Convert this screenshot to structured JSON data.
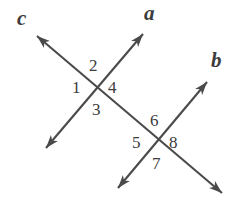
{
  "figure": {
    "kind": "geometry-diagram",
    "width": 245,
    "height": 204,
    "background_color": "#ffffff",
    "stroke_color": "#4a4a4a",
    "text_color": "#3c3c3c"
  },
  "lines": [
    {
      "id": "line-c",
      "label": "c",
      "label_x": 17,
      "label_y": 8,
      "start_x": 37,
      "start_y": 36,
      "end_x": 222,
      "end_y": 193,
      "arrow_start": true,
      "arrow_end": true
    },
    {
      "id": "line-a",
      "label": "a",
      "label_x": 144,
      "label_y": 3,
      "start_x": 143,
      "start_y": 34,
      "end_x": 46,
      "end_y": 148,
      "arrow_start": true,
      "arrow_end": true
    },
    {
      "id": "line-b",
      "label": "b",
      "label_x": 211,
      "label_y": 50,
      "start_x": 207,
      "start_y": 82,
      "end_x": 118,
      "end_y": 188,
      "arrow_start": true,
      "arrow_end": true
    }
  ],
  "intersections": [
    {
      "id": "intersection-upper",
      "x": 97,
      "y": 88,
      "lines": [
        "line-c",
        "line-a"
      ]
    },
    {
      "id": "intersection-lower",
      "x": 157,
      "y": 142,
      "lines": [
        "line-c",
        "line-b"
      ]
    }
  ],
  "angle_labels": [
    {
      "id": "angle-1",
      "text": "1",
      "x": 72,
      "y": 79,
      "intersection": "intersection-upper",
      "position": "left"
    },
    {
      "id": "angle-2",
      "text": "2",
      "x": 89,
      "y": 57,
      "intersection": "intersection-upper",
      "position": "top"
    },
    {
      "id": "angle-3",
      "text": "3",
      "x": 92,
      "y": 101,
      "intersection": "intersection-upper",
      "position": "bottom"
    },
    {
      "id": "angle-4",
      "text": "4",
      "x": 108,
      "y": 79,
      "intersection": "intersection-upper",
      "position": "right"
    },
    {
      "id": "angle-5",
      "text": "5",
      "x": 132,
      "y": 134,
      "intersection": "intersection-lower",
      "position": "left"
    },
    {
      "id": "angle-6",
      "text": "6",
      "x": 150,
      "y": 112,
      "intersection": "intersection-lower",
      "position": "top"
    },
    {
      "id": "angle-7",
      "text": "7",
      "x": 152,
      "y": 155,
      "intersection": "intersection-lower",
      "position": "bottom"
    },
    {
      "id": "angle-8",
      "text": "8",
      "x": 169,
      "y": 134,
      "intersection": "intersection-lower",
      "position": "right"
    }
  ]
}
